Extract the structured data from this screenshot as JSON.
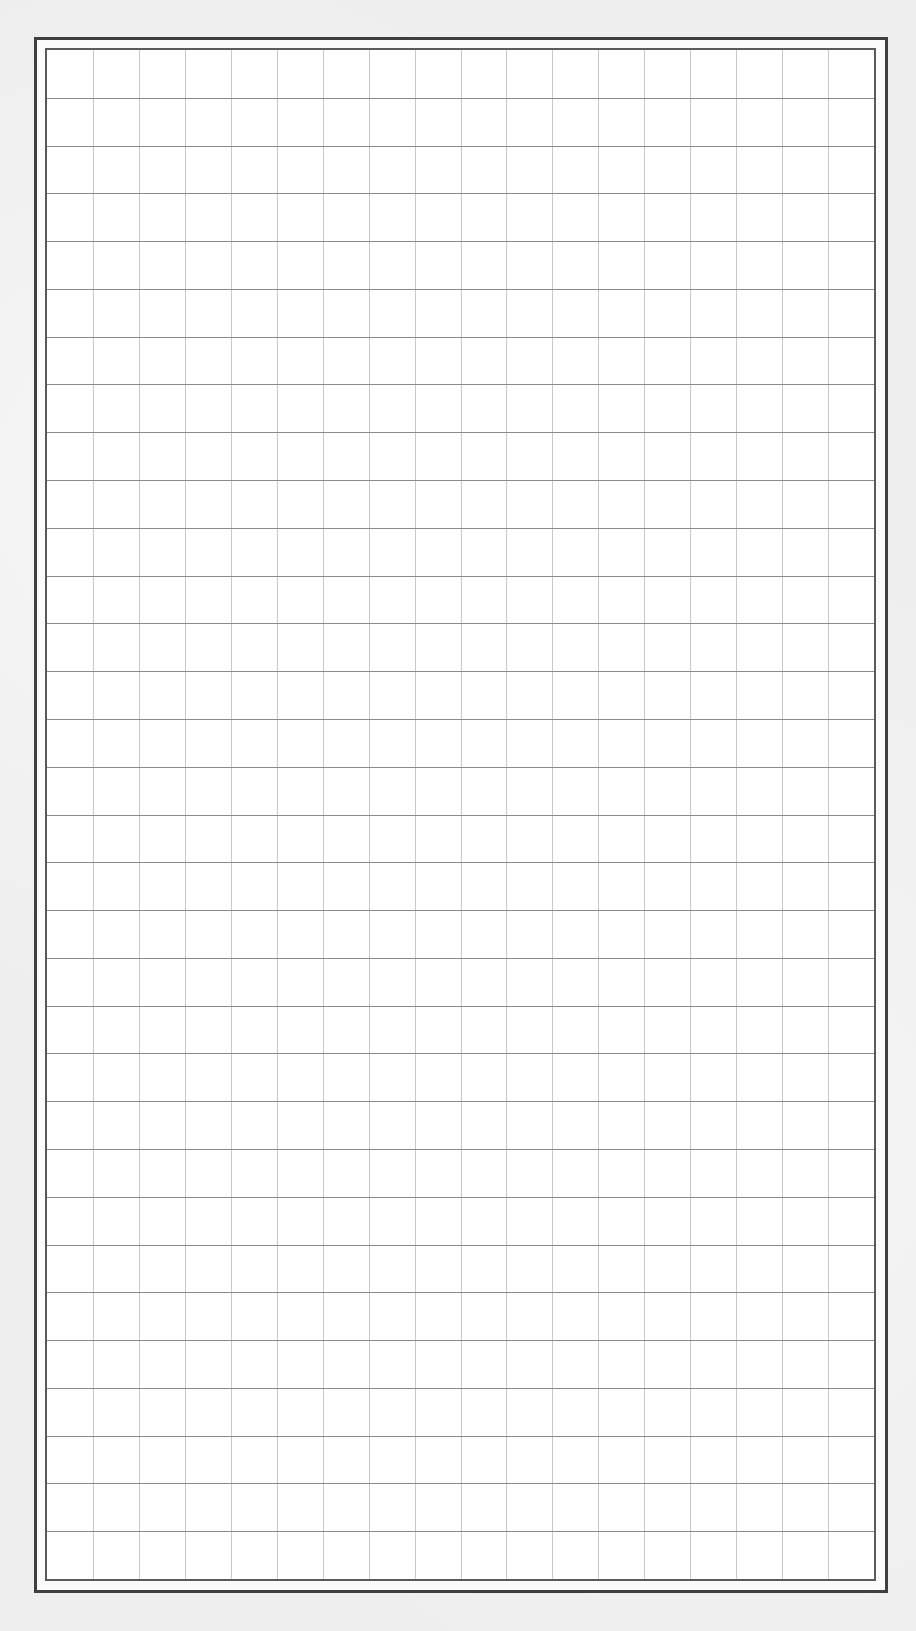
{
  "sheet": {
    "type": "grid-paper",
    "colors": {
      "paper_background": "#eeeeee",
      "outer_frame": "#3f3f3f",
      "inner_frame": "#5a5a5a",
      "grid_fill": "#ffffff",
      "vertical_lines": "#c9c9c9",
      "horizontal_lines": "#8a8a8a"
    },
    "outer_frame": {
      "x": 34,
      "y": 37,
      "width": 854,
      "height": 1556
    },
    "grid": {
      "x": 45,
      "y": 48,
      "width": 831,
      "height": 1533,
      "columns": 18,
      "rows": 32
    }
  }
}
